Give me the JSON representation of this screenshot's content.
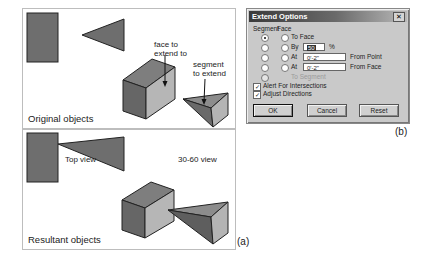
{
  "figure_a": {
    "tag": "(a)",
    "top_panel": {
      "label": "Original objects",
      "annotations": {
        "face": [
          "face to",
          "extend to"
        ],
        "segment": [
          "segment",
          "to extend"
        ]
      }
    },
    "bottom_panel": {
      "label": "Resultant objects",
      "annotations": {
        "top_view": "Top view",
        "iso_view": "30-60 view"
      }
    },
    "colors": {
      "dark_face": "#6e6e6e",
      "mid_face": "#8a8a8a",
      "light_face": "#b4b4b4",
      "outline": "#222222"
    }
  },
  "figure_b": {
    "tag": "(b)",
    "dialog": {
      "title": "Extend Options",
      "close_icon": "close-icon",
      "headers": {
        "segment": "Segment",
        "face": "Face"
      },
      "options": [
        {
          "label": "To Face",
          "segment_selected": true,
          "face_selected": false
        },
        {
          "label": "By",
          "value": "50",
          "unit": "%"
        },
        {
          "label": "At",
          "value": "0'-2\"",
          "suffix": "From Point"
        },
        {
          "label": "At",
          "value": "0'-2\"",
          "suffix": "From Face"
        },
        {
          "label": "To Segment",
          "disabled": true
        }
      ],
      "checkboxes": [
        {
          "label": "Alert For Intersections",
          "checked": true
        },
        {
          "label": "Adjust Directions",
          "checked": true
        }
      ],
      "buttons": {
        "ok": "OK",
        "cancel": "Cancel",
        "reset": "Reset"
      }
    }
  }
}
